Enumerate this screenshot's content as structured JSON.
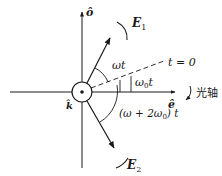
{
  "diagram": {
    "axes": {
      "vertical_label": "ô",
      "horizontal_label": "ê",
      "out_of_page_label": "k̂"
    },
    "vectors": {
      "e1_label": "E",
      "e1_sub": "1",
      "e2_label": "E",
      "e2_sub": "2"
    },
    "angles": {
      "omega_t": "ωt",
      "omega0_t_main": "ω",
      "omega0_t_sub": "0",
      "omega0_t_tail": "t",
      "e2_angle_prefix": "(ω + 2ω",
      "e2_angle_sub": "0",
      "e2_angle_suffix": ") t"
    },
    "reference_line_label": "t = 0",
    "optic_axis_label": "光轴",
    "colors": {
      "stroke": "#1a1a1a",
      "background": "#ffffff"
    }
  }
}
